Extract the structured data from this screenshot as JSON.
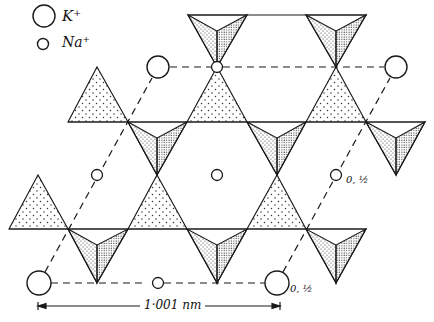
{
  "legend": {
    "items": [
      {
        "symbol": "large-circle",
        "label": "K⁺"
      },
      {
        "symbol": "small-circle",
        "label": "Na⁺"
      }
    ]
  },
  "annotations": {
    "height_label_mid": "0, ½",
    "height_label_bottom": "0, ½"
  },
  "scale_bar": {
    "label": "1·001 nm",
    "x_start": 38,
    "x_end": 280,
    "y": 306
  },
  "structure": {
    "k_ions": [
      [
        158,
        67
      ],
      [
        396,
        67
      ],
      [
        39,
        283
      ],
      [
        277,
        283
      ]
    ],
    "na_ions": [
      [
        217,
        67
      ],
      [
        97,
        175
      ],
      [
        217,
        175
      ],
      [
        336,
        175
      ],
      [
        158,
        283
      ]
    ],
    "unit_cell": [
      [
        39,
        283
      ],
      [
        277,
        283
      ],
      [
        396,
        67
      ],
      [
        158,
        67
      ]
    ],
    "colors": {
      "line": "#1a1a1a",
      "light_stipple": "#444444",
      "dense_stipple": "#222222",
      "background": "#ffffff"
    }
  }
}
